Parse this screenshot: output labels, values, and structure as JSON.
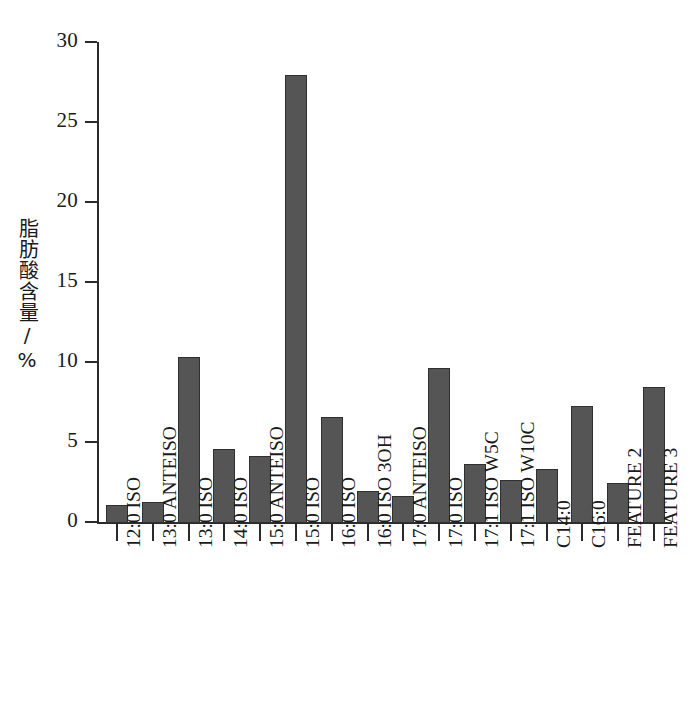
{
  "chart_data": {
    "type": "bar",
    "title": "",
    "xlabel": "",
    "ylabel": "脂肪酸含量/%",
    "ylim": [
      0,
      30
    ],
    "ytick_step": 5,
    "ytick_labels": [
      "0",
      "5",
      "10",
      "15",
      "20",
      "25",
      "30"
    ],
    "ytick_values": [
      0,
      5,
      10,
      15,
      20,
      25,
      30
    ],
    "grid": false,
    "legend": false,
    "bar_color": "#555555",
    "bar_edge_color": "#2f2f2f",
    "axis_color": "#2b2b2b",
    "categories": [
      "12:0 ISO",
      "13:0 ANTEISO",
      "13:0 ISO",
      "14:0 ISO",
      "15:0 ANTEISO",
      "15:0 ISO",
      "16:0 ISO",
      "16:0 ISO 3OH",
      "17:0 ANTEISO",
      "17:0 ISO",
      "17:1 ISO W5C",
      "17:1 ISO W10C",
      "C14:0",
      "C16:0",
      "FEATURE 2",
      "FEATURE 3"
    ],
    "values": [
      1.1,
      1.3,
      10.4,
      4.6,
      4.2,
      28.0,
      6.6,
      2.0,
      1.7,
      9.7,
      3.7,
      2.7,
      3.4,
      7.3,
      2.5,
      8.5
    ]
  }
}
